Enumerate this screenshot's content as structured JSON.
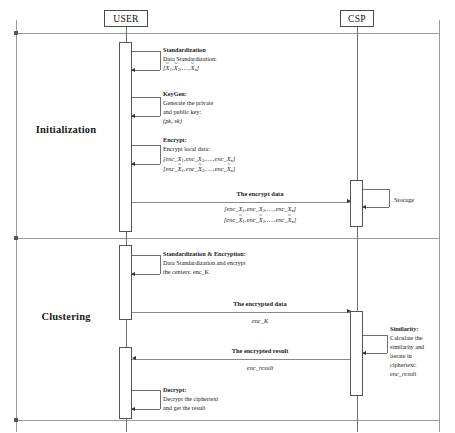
{
  "diagram": {
    "type": "uml-sequence-diagram",
    "colors": {
      "line": "#9a9a9a",
      "lifeline": "#6f6f6f",
      "activation_border": "#555555",
      "text": "#1a1a1a",
      "background": "#ffffff"
    }
  },
  "actors": [
    {
      "id": "user",
      "label": "USER"
    },
    {
      "id": "csp",
      "label": "CSP"
    }
  ],
  "phases": [
    {
      "id": "initialization",
      "label": "Initialization"
    },
    {
      "id": "clustering",
      "label": "Clustering"
    }
  ],
  "user_steps": [
    {
      "id": "standardization",
      "title": "Standardization",
      "lines": [
        "Data Standardization:"
      ],
      "formula_parts": [
        "[",
        "X",
        "1",
        ", ",
        "X",
        "2",
        ", . . . , ",
        "X",
        "n",
        "]"
      ]
    },
    {
      "id": "keygen",
      "title": "KeyGen:",
      "lines": [
        "Generate the private",
        "and public key:"
      ],
      "formula": "(pk, sk)"
    },
    {
      "id": "encrypt",
      "title": "Encrypt:",
      "lines": [
        "Encrypt local data:"
      ],
      "formula_1": "[enc_X1, enc_X2, . . . , enc_Xn]",
      "formula_2": "[enc_X̃1, enc_X̃2, . . . , enc_X̃n]"
    },
    {
      "id": "standardization-encryption",
      "title": "Standardization  &  Encryption:",
      "lines": [
        "Data Standardization and encrypt",
        "the centers:   enc_K"
      ]
    },
    {
      "id": "decrypt",
      "title": "Decrypt:",
      "lines": [
        "Decrypt the ciphertext",
        "and get the result"
      ]
    }
  ],
  "csp_steps": [
    {
      "id": "storage",
      "title": "Storage"
    },
    {
      "id": "similarity",
      "title": "Similarity:",
      "lines": [
        "Calculate the",
        "similarity and",
        "iterate in",
        "ciphertext:"
      ],
      "formula": "enc_result"
    }
  ],
  "messages": [
    {
      "id": "the-encrypt-data",
      "label": "The encrypt data",
      "from": "user",
      "to": "csp",
      "payload_1": "[enc_X1, enc_X2, . . . , enc_Xn]",
      "payload_2": "[enc_X̃1, enc_X̃2, . . . , enc_X̃n]"
    },
    {
      "id": "the-encrypted-data",
      "label": "The encrypted data",
      "from": "user",
      "to": "csp",
      "payload": "enc_K"
    },
    {
      "id": "the-encrypted-result",
      "label": "The encrypted result",
      "from": "csp",
      "to": "user",
      "payload": "enc_result"
    }
  ]
}
